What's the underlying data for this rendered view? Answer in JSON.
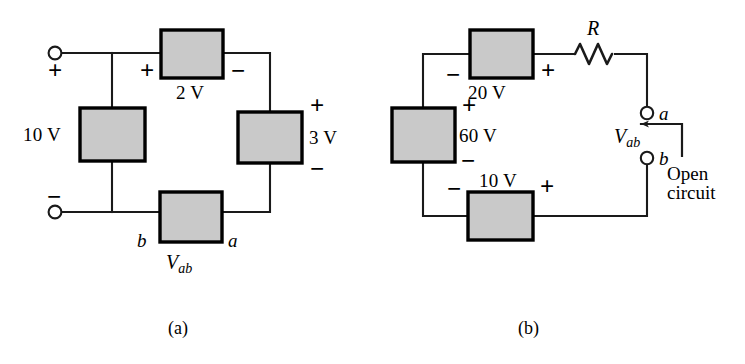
{
  "figure": {
    "type": "electrical-circuit-diagram",
    "panels": [
      {
        "id": "a",
        "caption": "(a)",
        "elements": {
          "top_source": {
            "value": "2 V",
            "plus": "+",
            "minus": "−"
          },
          "left_source": {
            "value": "10 V"
          },
          "right_source": {
            "value": "3 V",
            "plus": "+",
            "minus": "−"
          },
          "bottom_source": {
            "label": "V",
            "subscript": "ab"
          },
          "terminal_top": {
            "sign": "+"
          },
          "terminal_bottom": {
            "sign": "−"
          },
          "node_b": "b",
          "node_a": "a"
        }
      },
      {
        "id": "b",
        "caption": "(b)",
        "elements": {
          "top_source": {
            "value": "20 V",
            "minus": "−",
            "plus": "+"
          },
          "left_source": {
            "value": "60 V",
            "plus": "+",
            "minus": "−"
          },
          "bottom_source": {
            "value": "10 V",
            "minus": "−",
            "plus": "+"
          },
          "resistor": {
            "label": "R"
          },
          "node_a": "a",
          "node_b": "b",
          "measurement": {
            "label": "V",
            "subscript": "ab"
          },
          "annotation": {
            "line1": "Open",
            "line2": "circuit"
          }
        }
      }
    ]
  },
  "colors": {
    "background": "#ffffff",
    "wire": "#1a1a1a",
    "box_fill": "#c9c9c9",
    "box_stroke": "#000000",
    "text": "#000000"
  }
}
